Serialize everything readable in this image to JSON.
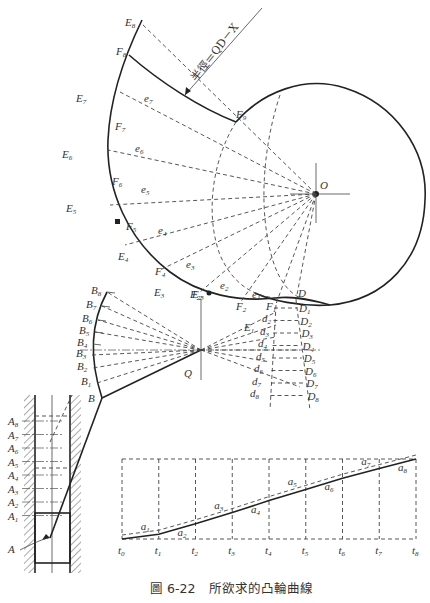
{
  "figure": {
    "caption_number": "圖 6-22",
    "caption_text": "所欲求的凸輪曲線",
    "annotation": "半徑＝QD－X"
  },
  "cam": {
    "center_label": "O",
    "base_point_label": "D",
    "pivot_label": "Q",
    "pivot_top_label": "E",
    "pivot_top_sub": "2",
    "e_points": [
      {
        "base": "e",
        "sub": "1"
      },
      {
        "base": "e",
        "sub": "2"
      },
      {
        "base": "e",
        "sub": "3"
      },
      {
        "base": "e",
        "sub": "4"
      },
      {
        "base": "e",
        "sub": "5"
      },
      {
        "base": "e",
        "sub": "6"
      },
      {
        "base": "e",
        "sub": "7"
      }
    ],
    "E_points": [
      {
        "base": "E",
        "sub": "1"
      },
      {
        "base": "E",
        "sub": "3"
      },
      {
        "base": "E",
        "sub": "4"
      },
      {
        "base": "E",
        "sub": "5"
      },
      {
        "base": "E",
        "sub": "6"
      },
      {
        "base": "E",
        "sub": "7"
      },
      {
        "base": "E",
        "sub": "8"
      }
    ],
    "F_points": [
      {
        "base": "F",
        "sub": "1"
      },
      {
        "base": "F",
        "sub": "2"
      },
      {
        "base": "F",
        "sub": "23"
      },
      {
        "base": "F",
        "sub": "4"
      },
      {
        "base": "F",
        "sub": "5"
      },
      {
        "base": "F",
        "sub": "6"
      },
      {
        "base": "F",
        "sub": "7"
      },
      {
        "base": "F",
        "sub": "8"
      },
      {
        "base": "F",
        "sub": "9"
      }
    ],
    "D_points": [
      {
        "base": "D",
        "sub": "1"
      },
      {
        "base": "D",
        "sub": "2"
      },
      {
        "base": "D",
        "sub": "3"
      },
      {
        "base": "D",
        "sub": "4"
      },
      {
        "base": "D",
        "sub": "5"
      },
      {
        "base": "D",
        "sub": "6"
      },
      {
        "base": "D",
        "sub": "7"
      },
      {
        "base": "D",
        "sub": "8"
      }
    ],
    "d_points": [
      {
        "base": "d",
        "sub": "2"
      },
      {
        "base": "d",
        "sub": "3"
      },
      {
        "base": "d",
        "sub": "4"
      },
      {
        "base": "d",
        "sub": "5"
      },
      {
        "base": "d",
        "sub": "6"
      },
      {
        "base": "d",
        "sub": "7"
      },
      {
        "base": "d",
        "sub": "8"
      }
    ]
  },
  "arm": {
    "B_points": [
      {
        "base": "B",
        "sub": ""
      },
      {
        "base": "B",
        "sub": "1"
      },
      {
        "base": "B",
        "sub": "2"
      },
      {
        "base": "B",
        "sub": "3"
      },
      {
        "base": "B",
        "sub": "4"
      },
      {
        "base": "B",
        "sub": "5"
      },
      {
        "base": "B",
        "sub": "6"
      },
      {
        "base": "B",
        "sub": "7"
      },
      {
        "base": "B",
        "sub": "8"
      }
    ]
  },
  "follower": {
    "A_points": [
      {
        "base": "A",
        "sub": ""
      },
      {
        "base": "A",
        "sub": "1"
      },
      {
        "base": "A",
        "sub": "2"
      },
      {
        "base": "A",
        "sub": "3"
      },
      {
        "base": "A",
        "sub": "4"
      },
      {
        "base": "A",
        "sub": "5"
      },
      {
        "base": "A",
        "sub": "6"
      },
      {
        "base": "A",
        "sub": "7"
      },
      {
        "base": "A",
        "sub": "8"
      }
    ]
  },
  "displacement_diagram": {
    "t_labels": [
      {
        "base": "t",
        "sub": "0"
      },
      {
        "base": "t",
        "sub": "1"
      },
      {
        "base": "t",
        "sub": "2"
      },
      {
        "base": "t",
        "sub": "3"
      },
      {
        "base": "t",
        "sub": "4"
      },
      {
        "base": "t",
        "sub": "5"
      },
      {
        "base": "t",
        "sub": "6"
      },
      {
        "base": "t",
        "sub": "7"
      },
      {
        "base": "t",
        "sub": "8"
      }
    ],
    "a_labels": [
      {
        "base": "a",
        "sub": "1"
      },
      {
        "base": "a",
        "sub": "2"
      },
      {
        "base": "a",
        "sub": "3"
      },
      {
        "base": "a",
        "sub": "4"
      },
      {
        "base": "a",
        "sub": "5"
      },
      {
        "base": "a",
        "sub": "6"
      },
      {
        "base": "a",
        "sub": "7"
      },
      {
        "base": "a",
        "sub": "8"
      }
    ],
    "displacement_fraction": [
      0,
      0.06,
      0.19,
      0.33,
      0.48,
      0.62,
      0.76,
      0.88,
      1.0
    ]
  }
}
